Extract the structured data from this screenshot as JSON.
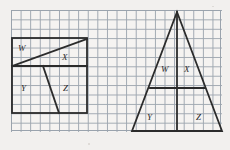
{
  "canvas": {
    "width": 230,
    "height": 150,
    "background": "#f2f0ee"
  },
  "grid": {
    "name": "graph-paper-grid",
    "left": 11,
    "top": 10,
    "width": 211,
    "height": 122,
    "cell_width": 9.6,
    "cell_height": 9.4,
    "columns": 22,
    "rows": 13,
    "line_color": "#9aa3ad"
  },
  "figures": [
    {
      "id": "rectangle-figure",
      "shape": "rectangle",
      "stroke": "#2b2b2b",
      "stroke_width": 1.8,
      "outline": {
        "x": 12,
        "y": 38,
        "width": 75,
        "height": 75
      },
      "divider": {
        "type": "horizontal",
        "x1": 12,
        "y1": 66,
        "x2": 87,
        "y2": 66
      },
      "segments": [
        {
          "id": "upper-diagonal",
          "x1": 12,
          "y1": 66,
          "x2": 87,
          "y2": 39
        },
        {
          "id": "lower-slant",
          "x1": 43,
          "y1": 66,
          "x2": 59,
          "y2": 113
        }
      ],
      "labels": [
        {
          "text": "W",
          "x": 18,
          "y": 44
        },
        {
          "text": "X",
          "x": 62,
          "y": 53
        },
        {
          "text": "Y",
          "x": 21,
          "y": 84
        },
        {
          "text": "Z",
          "x": 63,
          "y": 84
        }
      ]
    },
    {
      "id": "triangle-figure",
      "shape": "triangle",
      "stroke": "#2b2b2b",
      "stroke_width": 1.8,
      "apex": {
        "x": 177,
        "y": 12
      },
      "base_left": {
        "x": 132,
        "y": 131
      },
      "base_right": {
        "x": 222,
        "y": 131
      },
      "segments": [
        {
          "id": "vertical-median",
          "x1": 177,
          "y1": 12,
          "x2": 177,
          "y2": 131
        },
        {
          "id": "horizontal-midline",
          "x1": 150,
          "y1": 88,
          "x2": 205,
          "y2": 88
        }
      ],
      "labels": [
        {
          "text": "W",
          "x": 161,
          "y": 65
        },
        {
          "text": "X",
          "x": 184,
          "y": 65
        },
        {
          "text": "Y",
          "x": 147,
          "y": 113
        },
        {
          "text": "Z",
          "x": 196,
          "y": 113
        }
      ]
    }
  ],
  "region_labels": [
    "W",
    "X",
    "Y",
    "Z"
  ]
}
